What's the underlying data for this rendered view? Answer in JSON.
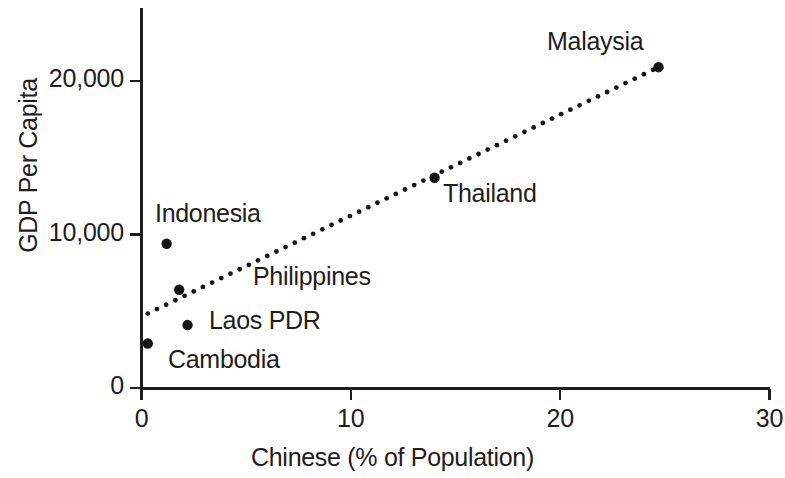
{
  "chart_data": {
    "type": "scatter",
    "title": "",
    "xlabel": "Chinese (% of Population)",
    "ylabel": "GDP Per Capita",
    "xlim": [
      0,
      30
    ],
    "ylim": [
      0,
      25000
    ],
    "grid": false,
    "legend": "none",
    "x_ticks": [
      {
        "value": 0,
        "label": "0"
      },
      {
        "value": 10,
        "label": "10"
      },
      {
        "value": 20,
        "label": "20"
      },
      {
        "value": 30,
        "label": "30"
      }
    ],
    "y_ticks": [
      {
        "value": 0,
        "label": "0"
      },
      {
        "value": 10000,
        "label": "10,000"
      },
      {
        "value": 20000,
        "label": "20,000"
      }
    ],
    "points": [
      {
        "name": "Cambodia",
        "x": 0.3,
        "y": 2900,
        "label": "Cambodia",
        "label_x": 168,
        "label_y": 345
      },
      {
        "name": "Indonesia",
        "x": 1.2,
        "y": 9400,
        "label": "Indonesia",
        "label_x": 155,
        "label_y": 199
      },
      {
        "name": "Philippines",
        "x": 1.8,
        "y": 6400,
        "label": "Philippines",
        "label_x": 253,
        "label_y": 262
      },
      {
        "name": "Laos PDR",
        "x": 2.2,
        "y": 4100,
        "label": "Laos PDR",
        "label_x": 209,
        "label_y": 306
      },
      {
        "name": "Thailand",
        "x": 14.0,
        "y": 13700,
        "label": "Thailand",
        "label_x": 443,
        "label_y": 179
      },
      {
        "name": "Malaysia",
        "x": 24.7,
        "y": 20900,
        "label": "Malaysia",
        "label_x": 547,
        "label_y": 27
      }
    ],
    "trendline": {
      "style": "dotted",
      "x0": 0.3,
      "y0": 4850,
      "x1": 24.7,
      "y1": 20900
    },
    "colors": {
      "ink": "#1d1d1d",
      "background": "#ffffff",
      "marker": "#151515",
      "trendline": "#151515"
    }
  }
}
